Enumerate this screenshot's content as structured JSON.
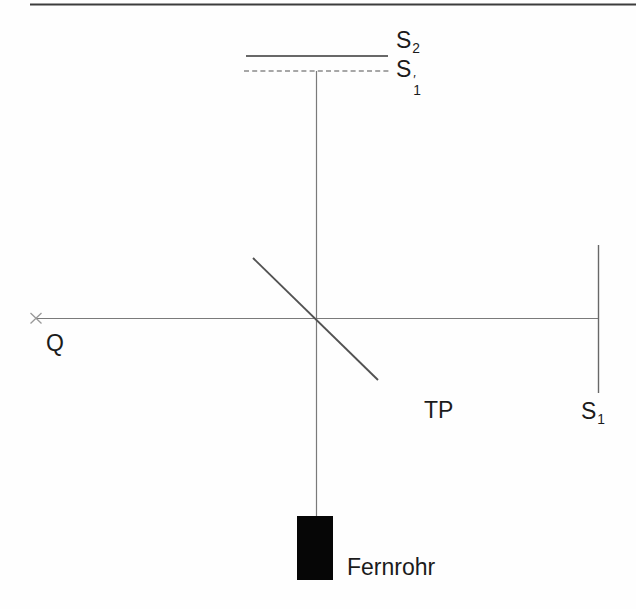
{
  "colors": {
    "background": "#fefefe",
    "top_rule": "#3d3d3d",
    "beam_line": "#7a7a7a",
    "mirror_line": "#686868",
    "dashed_line": "#8a8a8a",
    "splitter_line": "#525252",
    "source_marker": "#999999",
    "telescope_fill": "#060606",
    "text": "#1b1b1b"
  },
  "labels": {
    "mirror_s2": {
      "base": "S",
      "sub": "2"
    },
    "virtual_image_s1": {
      "base": "S",
      "prime": "′",
      "sub": "1"
    },
    "source": "Q",
    "beam_splitter": "TP",
    "mirror_s1": {
      "base": "S",
      "sub": "1"
    },
    "telescope": "Fernrohr"
  }
}
